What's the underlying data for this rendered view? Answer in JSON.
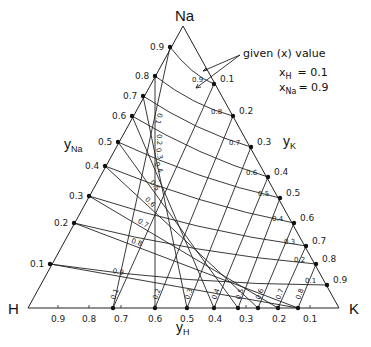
{
  "vertices": {
    "top": {
      "label": "Na",
      "x": 183,
      "y": 26
    },
    "left": {
      "label": "H",
      "x": 28,
      "y": 308
    },
    "right": {
      "label": "K",
      "x": 339,
      "y": 308
    }
  },
  "axes": {
    "left": {
      "label": "y",
      "sub": "Na"
    },
    "right": {
      "label": "y",
      "sub": "K"
    },
    "bottom": {
      "label": "y",
      "sub": "H"
    }
  },
  "annotation": {
    "text": "given (x) value",
    "line1_var": "x",
    "line1_sub": "H",
    "line1_val": "= 0.1",
    "line2_var": "x",
    "line2_sub": "Na",
    "line2_val": "= 0.9"
  },
  "left_ticks": [
    "0.9",
    "0.8",
    "0.7",
    "0.6",
    "0.5",
    "0.4",
    "0.3",
    "0.2",
    "0.1"
  ],
  "right_ticks": [
    "0.1",
    "0.2",
    "0.3",
    "0.4",
    "0.5",
    "0.6",
    "0.7",
    "0.8",
    "0.9"
  ],
  "bottom_ticks": [
    "0.9",
    "0.8",
    "0.7",
    "0.6",
    "0.5",
    "0.4",
    "0.3",
    "0.2",
    "0.1"
  ],
  "left_dots": [
    [
      170,
      47
    ],
    [
      155,
      76
    ],
    [
      143,
      96
    ],
    [
      132,
      116
    ],
    [
      118,
      142
    ],
    [
      105,
      166
    ],
    [
      89,
      196
    ],
    [
      74,
      223
    ],
    [
      50,
      264
    ]
  ],
  "right_dots": [
    [
      214,
      84
    ],
    [
      233,
      116
    ],
    [
      251,
      147
    ],
    [
      268,
      177
    ],
    [
      280,
      198
    ],
    [
      294,
      223
    ],
    [
      306,
      246
    ],
    [
      316,
      264
    ],
    [
      327,
      285
    ]
  ],
  "base_dots": [
    [
      113,
      308
    ],
    [
      155,
      308
    ],
    [
      187,
      308
    ],
    [
      214,
      308
    ],
    [
      238,
      308
    ],
    [
      258,
      308
    ],
    [
      278,
      308
    ],
    [
      298,
      308
    ]
  ],
  "curve_labels_xH": [
    "0.9",
    "0.8",
    "0.7",
    "0.6",
    "0.5",
    "0.4",
    "0.3",
    "0.2",
    "0.1"
  ],
  "diag_labels_xNa": [
    "0.1",
    "0.2",
    "0.3",
    "0.4",
    "0.5",
    "0.6",
    "0.7",
    "0.8",
    "0.9"
  ],
  "base_line_labels": [
    "0.1",
    "0.2",
    "0.3",
    "0.4",
    "0.5",
    "0.6",
    "0.7",
    "0.8",
    "0.9"
  ]
}
